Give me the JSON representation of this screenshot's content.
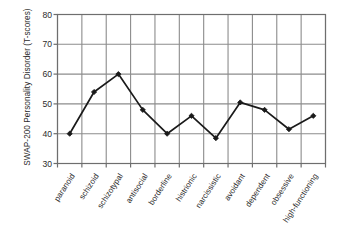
{
  "chart_data": {
    "type": "line",
    "title": "",
    "subtitle": "",
    "xlabel": "",
    "ylabel": "SWAP-200 Personality Disorder (T-scores)",
    "categories": [
      "paranoid",
      "schizoid",
      "schizotypal",
      "antisocial",
      "borderline",
      "histrionic",
      "narcissistic",
      "avoidant",
      "dependent",
      "obsessive",
      "high-functioning"
    ],
    "values": [
      40,
      54,
      60,
      48,
      40,
      46,
      38.5,
      50.5,
      48,
      41.5,
      46
    ],
    "ylim": [
      30,
      80
    ],
    "yticks": [
      30,
      40,
      50,
      60,
      70,
      80
    ],
    "ytick_labels": [
      "30",
      "40",
      "50",
      "60",
      "70",
      "80"
    ],
    "grid": {
      "horizontal": true,
      "vertical": true
    },
    "legend": {
      "show": false,
      "position": "none",
      "entries": []
    },
    "series": [
      {
        "name": "SWAP-200 T-score",
        "values": [
          40,
          54,
          60,
          48,
          40,
          46,
          38.5,
          50.5,
          48,
          41.5,
          46
        ],
        "line_color": "#1a1a1a",
        "marker": "diamond",
        "marker_color": "#1a1a1a"
      }
    ],
    "annotations": []
  },
  "style": {
    "background_color": "#ffffff",
    "grid_color": "#8c8c8c",
    "axis_color": "#6e6e6e",
    "text_color": "#2b2b2b",
    "line_color": "#1a1a1a"
  }
}
